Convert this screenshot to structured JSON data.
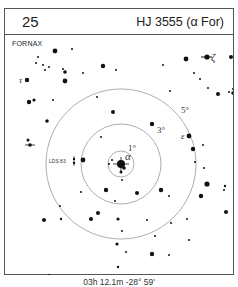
{
  "header": {
    "chart_number": "25",
    "title": "HJ 3555 (α For)"
  },
  "chart": {
    "constellation": "FORNAX",
    "center": {
      "x": 116,
      "y": 129
    },
    "rings": [
      {
        "label": "1°",
        "radius": 13
      },
      {
        "label": "3°",
        "radius": 40
      },
      {
        "label": "5°",
        "radius": 75
      }
    ],
    "ring_color": "#999999",
    "star_color": "#111111",
    "labels": {
      "alpha": "α",
      "epsilon": "ε",
      "zeta": "ζ",
      "tau": "τ",
      "lds": "LDS 83",
      "ring1": "1°",
      "ring3": "3°",
      "ring5": "5°"
    },
    "stars": [
      {
        "x": 50,
        "y": 16,
        "r": 2.4
      },
      {
        "x": 67,
        "y": 14,
        "r": 1
      },
      {
        "x": 33,
        "y": 22,
        "r": 1
      },
      {
        "x": 31,
        "y": 28,
        "r": 1
      },
      {
        "x": 38,
        "y": 30,
        "r": 1
      },
      {
        "x": 44,
        "y": 32,
        "r": 1
      },
      {
        "x": 40,
        "y": 35,
        "r": 1
      },
      {
        "x": 58,
        "y": 34,
        "r": 1
      },
      {
        "x": 60,
        "y": 37,
        "r": 1.8
      },
      {
        "x": 60,
        "y": 46,
        "r": 2.4
      },
      {
        "x": 78,
        "y": 38,
        "r": 1
      },
      {
        "x": 98,
        "y": 31,
        "r": 2.2
      },
      {
        "x": 111,
        "y": 35,
        "r": 1
      },
      {
        "x": 92,
        "y": 62,
        "r": 1
      },
      {
        "x": 24,
        "y": 67,
        "r": 2.2
      },
      {
        "x": 29,
        "y": 65,
        "r": 1.6
      },
      {
        "x": 48,
        "y": 65,
        "r": 1
      },
      {
        "x": 42,
        "y": 86,
        "r": 1.8
      },
      {
        "x": 23,
        "y": 105,
        "r": 1.5
      },
      {
        "x": 78,
        "y": 125,
        "r": 2.4
      },
      {
        "x": 96,
        "y": 102,
        "r": 1
      },
      {
        "x": 108,
        "y": 77,
        "r": 2
      },
      {
        "x": 147,
        "y": 89,
        "r": 2.2
      },
      {
        "x": 158,
        "y": 30,
        "r": 1
      },
      {
        "x": 165,
        "y": 56,
        "r": 1
      },
      {
        "x": 189,
        "y": 38,
        "r": 1
      },
      {
        "x": 195,
        "y": 44,
        "r": 1
      },
      {
        "x": 203,
        "y": 53,
        "r": 1
      },
      {
        "x": 213,
        "y": 59,
        "r": 2
      },
      {
        "x": 228,
        "y": 58,
        "r": 1.8
      },
      {
        "x": 228,
        "y": 54,
        "r": 1
      },
      {
        "x": 224,
        "y": 57,
        "r": 1
      },
      {
        "x": 226,
        "y": 22,
        "r": 2
      },
      {
        "x": 181,
        "y": 24,
        "r": 2.4
      },
      {
        "x": 188,
        "y": 114,
        "r": 2.2
      },
      {
        "x": 198,
        "y": 110,
        "r": 1
      },
      {
        "x": 190,
        "y": 127,
        "r": 1
      },
      {
        "x": 199,
        "y": 133,
        "r": 1
      },
      {
        "x": 202,
        "y": 149,
        "r": 2.6
      },
      {
        "x": 220,
        "y": 151,
        "r": 1.2
      },
      {
        "x": 107,
        "y": 125,
        "r": 1
      },
      {
        "x": 104,
        "y": 129,
        "r": 1
      },
      {
        "x": 119,
        "y": 133,
        "r": 1.8
      },
      {
        "x": 116,
        "y": 137,
        "r": 1.5
      },
      {
        "x": 117,
        "y": 145,
        "r": 1
      },
      {
        "x": 101,
        "y": 155,
        "r": 2.2
      },
      {
        "x": 76,
        "y": 157,
        "r": 1
      },
      {
        "x": 110,
        "y": 166,
        "r": 1
      },
      {
        "x": 93,
        "y": 178,
        "r": 2
      },
      {
        "x": 86,
        "y": 184,
        "r": 2
      },
      {
        "x": 55,
        "y": 171,
        "r": 1
      },
      {
        "x": 39,
        "y": 185,
        "r": 2
      },
      {
        "x": 56,
        "y": 184,
        "r": 1.2
      },
      {
        "x": 113,
        "y": 184,
        "r": 1.6
      },
      {
        "x": 132,
        "y": 158,
        "r": 2
      },
      {
        "x": 142,
        "y": 185,
        "r": 1
      },
      {
        "x": 117,
        "y": 196,
        "r": 1
      },
      {
        "x": 121,
        "y": 217,
        "r": 1
      },
      {
        "x": 112,
        "y": 209,
        "r": 1.6
      },
      {
        "x": 113,
        "y": 232,
        "r": 1.2
      },
      {
        "x": 156,
        "y": 155,
        "r": 2.2
      },
      {
        "x": 164,
        "y": 161,
        "r": 1
      },
      {
        "x": 166,
        "y": 188,
        "r": 1
      },
      {
        "x": 150,
        "y": 201,
        "r": 1
      },
      {
        "x": 164,
        "y": 220,
        "r": 1
      },
      {
        "x": 147,
        "y": 219,
        "r": 2.2
      },
      {
        "x": 219,
        "y": 155,
        "r": 1
      },
      {
        "x": 221,
        "y": 177,
        "r": 2
      },
      {
        "x": 196,
        "y": 161,
        "r": 2.2
      },
      {
        "x": 182,
        "y": 184,
        "r": 1
      },
      {
        "x": 184,
        "y": 205,
        "r": 1
      },
      {
        "x": 44,
        "y": 241,
        "r": 2
      },
      {
        "x": 104,
        "y": 242,
        "r": 1
      },
      {
        "x": 127,
        "y": 251,
        "r": 1
      },
      {
        "x": 172,
        "y": 245,
        "r": 2.4
      },
      {
        "x": 177,
        "y": 251,
        "r": 1
      }
    ],
    "primary": {
      "x": 116,
      "y": 129,
      "r": 4
    },
    "epsilon": {
      "x": 184,
      "y": 101,
      "r": 2.4
    },
    "zeta": {
      "x": 202,
      "y": 22,
      "r": 2.6
    },
    "tau": {
      "x": 22,
      "y": 45,
      "r": 2.2
    },
    "lds": {
      "x": 69,
      "y": 126
    },
    "left_star": {
      "x": 25,
      "y": 110,
      "r": 1.8
    }
  },
  "footer": {
    "coordinates": "03h 12.1m  -28° 59'"
  }
}
